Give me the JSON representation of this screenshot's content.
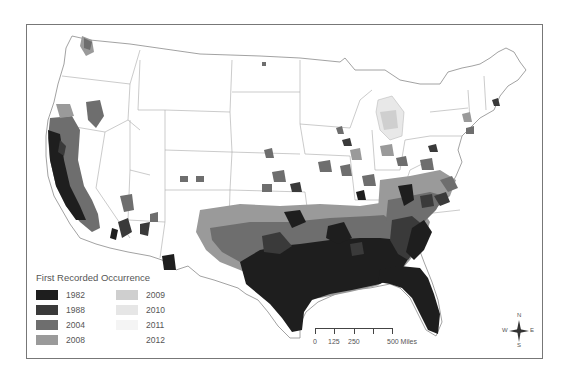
{
  "map": {
    "subject": "Contiguous United States",
    "legend": {
      "title": "First Recorded Occurrence",
      "items": [
        {
          "label": "1982",
          "color": "#1e1e1e"
        },
        {
          "label": "2009",
          "color": "#cfcfcf"
        },
        {
          "label": "1988",
          "color": "#3a3a3a"
        },
        {
          "label": "2010",
          "color": "#e6e6e6"
        },
        {
          "label": "2004",
          "color": "#6e6e6e"
        },
        {
          "label": "2011",
          "color": "#f4f4f4"
        },
        {
          "label": "2008",
          "color": "#9a9a9a"
        },
        {
          "label": "2012",
          "color": "#ffffff"
        }
      ]
    },
    "scale_bar": {
      "labels": [
        "0",
        "125",
        "250",
        "500 Miles"
      ]
    },
    "compass": {
      "n": "N",
      "s": "S",
      "e": "E",
      "w": "W"
    },
    "colors": {
      "border": "#777777",
      "state_lines": "#9a9a9a",
      "background": "#ffffff"
    }
  }
}
